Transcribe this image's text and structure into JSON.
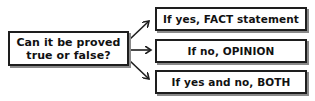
{
  "diagram": {
    "type": "flowchart",
    "question": {
      "line1": "Can it be proved",
      "line2": "true or false?"
    },
    "outcomes": [
      {
        "label": "If yes, FACT statement"
      },
      {
        "label": "If no, OPINION"
      },
      {
        "label": "If yes and no, BOTH"
      }
    ],
    "colors": {
      "border": "#1e1e1e",
      "shadow": "#8a8a8a",
      "text": "#111111",
      "background": "#ffffff"
    }
  }
}
